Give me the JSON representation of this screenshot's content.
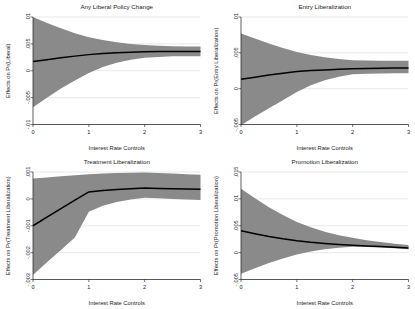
{
  "figure": {
    "background_color": "#ffffff",
    "band_color": "#8a8a8a",
    "line_color": "#000000",
    "gridline_color": "#c8c8c8"
  },
  "chart_data": [
    {
      "type": "line",
      "title": "Any Liberal Policy Change",
      "xlabel": "Interest Rate Controls",
      "ylabel": "Effects on Pr(Liberal)",
      "grid": true,
      "legend": "none",
      "xlim": [
        0,
        3
      ],
      "ylim": [
        -0.01,
        0.01
      ],
      "xticks": [
        0,
        1,
        2,
        3
      ],
      "xticklabels": [
        "0",
        "1",
        "2",
        "3"
      ],
      "yticks": [
        -0.01,
        -0.005,
        0,
        0.005,
        0.01
      ],
      "yticklabels": [
        "-.01",
        "-.005",
        "0",
        ".005",
        ".01"
      ],
      "x": [
        0,
        0.25,
        0.5,
        0.75,
        1,
        1.25,
        1.5,
        1.75,
        2,
        2.25,
        2.5,
        2.75,
        3
      ],
      "series": [
        {
          "name": "Marginal effect",
          "values": [
            0.0017,
            0.00205,
            0.0024,
            0.00272,
            0.003,
            0.0032,
            0.00334,
            0.00344,
            0.00352,
            0.00356,
            0.00358,
            0.00358,
            0.00356
          ]
        }
      ],
      "ci_upper": [
        0.01,
        0.0089,
        0.0079,
        0.007,
        0.00625,
        0.0057,
        0.0053,
        0.005,
        0.00478,
        0.00465,
        0.00457,
        0.00452,
        0.0045
      ],
      "ci_lower": [
        -0.0068,
        -0.005,
        -0.0033,
        -0.0018,
        -0.0004,
        0.0007,
        0.0015,
        0.00205,
        0.0024,
        0.00258,
        0.00268,
        0.00272,
        0.00272
      ]
    },
    {
      "type": "line",
      "title": "Entry Liberalization",
      "xlabel": "Interest Rate Controls",
      "ylabel": "Effects on Pr(Entry Liberalization)",
      "grid": true,
      "legend": "none",
      "xlim": [
        0,
        3
      ],
      "ylim": [
        -0.005,
        0.01
      ],
      "xticks": [
        0,
        1,
        2,
        3
      ],
      "xticklabels": [
        "0",
        "1",
        "2",
        "3"
      ],
      "yticks": [
        -0.005,
        0,
        0.005,
        0.01
      ],
      "yticklabels": [
        "-.005",
        "0",
        ".005",
        ".01"
      ],
      "x": [
        0,
        0.25,
        0.5,
        0.75,
        1,
        1.25,
        1.5,
        1.75,
        2,
        2.25,
        2.5,
        2.75,
        3
      ],
      "series": [
        {
          "name": "Marginal effect",
          "values": [
            0.0013,
            0.0016,
            0.0019,
            0.00215,
            0.00238,
            0.00252,
            0.00262,
            0.0027,
            0.00277,
            0.00282,
            0.00286,
            0.00288,
            0.0029
          ]
        }
      ],
      "ci_upper": [
        0.0077,
        0.007,
        0.0063,
        0.00568,
        0.00512,
        0.0047,
        0.00438,
        0.00415,
        0.00398,
        0.00392,
        0.0039,
        0.0039,
        0.0039
      ],
      "ci_lower": [
        -0.0051,
        -0.0039,
        -0.00272,
        -0.0016,
        -0.00048,
        0.00048,
        0.00118,
        0.00168,
        0.002,
        0.00208,
        0.00212,
        0.00214,
        0.00214
      ]
    },
    {
      "type": "line",
      "title": "Treatment Liberalization",
      "xlabel": "Interest Rate Controls",
      "ylabel": "Effects on Pr(Treatment Liberalization)",
      "grid": true,
      "legend": "none",
      "xlim": [
        0,
        3
      ],
      "ylim": [
        -0.003,
        0.001
      ],
      "xticks": [
        0,
        1,
        2,
        3
      ],
      "xticklabels": [
        "0",
        "1",
        "2",
        "3"
      ],
      "yticks": [
        -0.003,
        -0.002,
        -0.001,
        0,
        0.001
      ],
      "yticklabels": [
        "-.003",
        "-.002",
        "-.001",
        "0",
        ".001"
      ],
      "x": [
        0,
        0.25,
        0.5,
        0.75,
        1,
        1.25,
        1.5,
        1.75,
        2,
        2.25,
        2.5,
        2.75,
        3
      ],
      "series": [
        {
          "name": "Marginal effect",
          "values": [
            -0.001,
            -0.00068,
            -0.00036,
            -5e-05,
            0.00026,
            0.00031,
            0.00035,
            0.00038,
            0.0004,
            0.00039,
            0.00038,
            0.00037,
            0.00036
          ]
        }
      ],
      "ci_upper": [
        0.00076,
        0.0008,
        0.00084,
        0.00088,
        0.00092,
        0.00094,
        0.00096,
        0.00097,
        0.00098,
        0.00096,
        0.00094,
        0.00092,
        0.0009
      ],
      "ci_lower": [
        -0.00283,
        -0.00236,
        -0.0019,
        -0.00144,
        -0.00048,
        -0.00026,
        -0.00012,
        -2e-05,
        4e-05,
        2e-05,
        0.0,
        -2e-05,
        -4e-05
      ]
    },
    {
      "type": "line",
      "title": "Promotion Liberalization",
      "xlabel": "Interest Rate Controls",
      "ylabel": "Effects on Pr(Promotion Liberalization)",
      "grid": true,
      "legend": "none",
      "xlim": [
        0,
        3
      ],
      "ylim": [
        -0.005,
        0.015
      ],
      "xticks": [
        0,
        1,
        2,
        3
      ],
      "xticklabels": [
        "0",
        "1",
        "2",
        "3"
      ],
      "yticks": [
        -0.005,
        0,
        0.005,
        0.01,
        0.015
      ],
      "yticklabels": [
        "-.005",
        "0",
        ".005",
        ".01",
        ".015"
      ],
      "x": [
        0,
        0.25,
        0.5,
        0.75,
        1,
        1.25,
        1.5,
        1.75,
        2,
        2.25,
        2.5,
        2.75,
        3
      ],
      "series": [
        {
          "name": "Marginal effect",
          "values": [
            0.00405,
            0.0035,
            0.003,
            0.00258,
            0.00222,
            0.00193,
            0.0017,
            0.00152,
            0.00138,
            0.00125,
            0.00112,
            0.00098,
            0.00085
          ]
        }
      ],
      "ci_upper": [
        0.0119,
        0.0101,
        0.00845,
        0.007,
        0.0057,
        0.0047,
        0.0039,
        0.00325,
        0.00275,
        0.00232,
        0.00196,
        0.00166,
        0.0014
      ],
      "ci_lower": [
        -0.00395,
        -0.0029,
        -0.00195,
        -0.0011,
        -0.00035,
        0.00022,
        0.00062,
        0.0009,
        0.00108,
        0.00105,
        0.00096,
        0.00082,
        0.00062
      ]
    }
  ]
}
